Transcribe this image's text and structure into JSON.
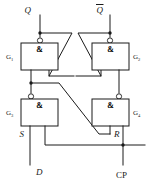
{
  "figure": {
    "kind": "logic-circuit-schematic",
    "gate_symbol": "&",
    "line_color": "#1a1a1a",
    "background_color": "#ffffff"
  },
  "gates": [
    {
      "id": "G1",
      "name": "G",
      "subscript": "1",
      "symbol": "&",
      "type": "NAND",
      "position": "top-left",
      "label_side": "left"
    },
    {
      "id": "G2",
      "name": "G",
      "subscript": "2",
      "symbol": "&",
      "type": "NAND",
      "position": "top-right",
      "label_side": "right"
    },
    {
      "id": "G3",
      "name": "G",
      "subscript": "3",
      "symbol": "&",
      "type": "NAND",
      "position": "bottom-left",
      "label_side": "left"
    },
    {
      "id": "G4",
      "name": "G",
      "subscript": "4",
      "symbol": "&",
      "type": "NAND",
      "position": "bottom-right",
      "label_side": "right"
    }
  ],
  "terminals": [
    {
      "id": "Q",
      "label": "Q",
      "overbar": false,
      "italic": true,
      "location": "top-left"
    },
    {
      "id": "Qbar",
      "label": "Q",
      "overbar": true,
      "italic": true,
      "location": "top-right"
    },
    {
      "id": "S",
      "label": "S",
      "overbar": false,
      "italic": true,
      "location": "middle-left"
    },
    {
      "id": "R",
      "label": "R",
      "overbar": false,
      "italic": true,
      "location": "middle-right"
    },
    {
      "id": "D",
      "label": "D",
      "overbar": false,
      "italic": true,
      "location": "bottom-left"
    },
    {
      "id": "CP",
      "label": "CP",
      "overbar": false,
      "italic": false,
      "location": "bottom-right"
    }
  ],
  "nets": [
    {
      "from": "G1.out",
      "to": "Q",
      "note": "Q output tapped at junction dot"
    },
    {
      "from": "G2.out",
      "to": "Qbar",
      "note": "Q-bar output tapped at junction dot"
    },
    {
      "from": "G1.out",
      "to": "G2.in2",
      "note": "cross-coupled feedback"
    },
    {
      "from": "G2.out",
      "to": "G1.in2",
      "note": "cross-coupled feedback"
    },
    {
      "from": "G3.out",
      "to": "G1.in1",
      "note": "S drives G1"
    },
    {
      "from": "G4.out",
      "to": "G2.in1",
      "note": "R drives G2"
    },
    {
      "from": "G3.out",
      "to": "G4.in1",
      "note": "diagonal from S node to R input"
    },
    {
      "from": "D",
      "to": "G3.in1",
      "note": "data input"
    },
    {
      "from": "CP",
      "to": "G3.in2",
      "note": "clock bus"
    },
    {
      "from": "CP",
      "to": "G4.in2",
      "note": "clock bus"
    }
  ]
}
